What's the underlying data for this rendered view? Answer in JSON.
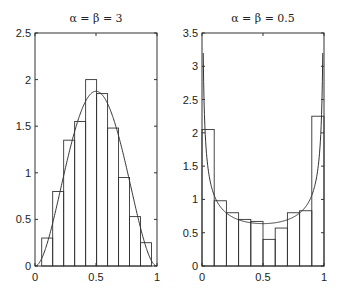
{
  "chart_data": [
    {
      "type": "bar",
      "title": "α = β = 3",
      "xlabel": "",
      "ylabel": "",
      "xlim": [
        0,
        1
      ],
      "ylim": [
        0,
        2.5
      ],
      "xticks": [
        0,
        0.5,
        1
      ],
      "xtick_labels": [
        "0",
        "0.5",
        "1"
      ],
      "yticks": [
        0,
        0.5,
        1,
        1.5,
        2,
        2.5
      ],
      "ytick_labels": [
        "0",
        "0.5",
        "1",
        "1.5",
        "2",
        "2.5"
      ],
      "grid": false,
      "histogram": {
        "bin_edges": [
          0.055,
          0.145,
          0.235,
          0.325,
          0.415,
          0.505,
          0.595,
          0.685,
          0.775,
          0.865,
          0.955
        ],
        "values": [
          0.3,
          0.8,
          1.35,
          1.55,
          2.0,
          1.85,
          1.48,
          0.95,
          0.53,
          0.25
        ]
      },
      "curve": {
        "name": "Beta(3,3) density",
        "alpha": 3,
        "beta": 3,
        "peak_value": 1.875
      }
    },
    {
      "type": "bar",
      "title": "α = β = 0.5",
      "xlabel": "",
      "ylabel": "",
      "xlim": [
        0,
        1
      ],
      "ylim": [
        0,
        3.5
      ],
      "xticks": [
        0,
        0.5,
        1
      ],
      "xtick_labels": [
        "0",
        "0.5",
        "1"
      ],
      "yticks": [
        0,
        0.5,
        1,
        1.5,
        2,
        2.5,
        3,
        3.5
      ],
      "ytick_labels": [
        "0",
        "0.5",
        "1",
        "1.5",
        "2",
        "2.5",
        "3",
        "3.5"
      ],
      "grid": false,
      "histogram": {
        "bin_edges": [
          0,
          0.1,
          0.2,
          0.3,
          0.4,
          0.5,
          0.6,
          0.7,
          0.8,
          0.9,
          1.0
        ],
        "values": [
          2.05,
          0.98,
          0.8,
          0.7,
          0.67,
          0.4,
          0.57,
          0.8,
          0.83,
          2.25
        ]
      },
      "curve": {
        "name": "Beta(0.5,0.5) density",
        "alpha": 0.5,
        "beta": 0.5,
        "clip_max": 3.2,
        "min_value": 0.637
      }
    }
  ],
  "layout": {
    "panels": [
      {
        "x0": 35,
        "x1": 157,
        "y_top": 33,
        "y_bottom": 266
      },
      {
        "x0": 202,
        "x1": 324,
        "y_top": 33,
        "y_bottom": 266
      }
    ],
    "colors": {
      "axis": "#333333",
      "bars": "#333333",
      "curve": "#333333",
      "background": "#ffffff"
    }
  }
}
